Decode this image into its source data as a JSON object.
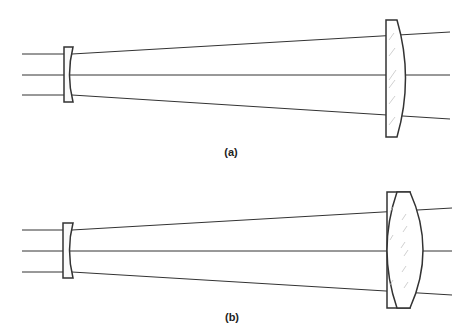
{
  "figure": {
    "panels": [
      {
        "id": "a",
        "label": "(a)",
        "description": "Negative meniscus/plano-concave lens followed by plano-convex lens; three parallel rays diverging",
        "rays_in_y": [
          54,
          75,
          95
        ],
        "rays_out_y": [
          32,
          75,
          119
        ]
      },
      {
        "id": "b",
        "label": "(b)",
        "description": "Plano-concave lens followed by cemented doublet (plano element + biconvex element); three parallel rays diverging",
        "rays_in_y": [
          230,
          251,
          272
        ],
        "rays_out_y": [
          208,
          251,
          295
        ]
      }
    ],
    "colors": {
      "line": "#333333",
      "hatch": "#aaaaaa",
      "background": "#ffffff"
    }
  }
}
